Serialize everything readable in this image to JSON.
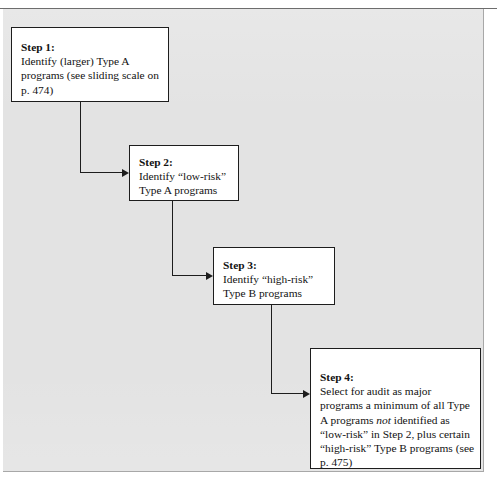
{
  "page": {
    "running_head": "",
    "background_color": "#ffffff",
    "panel_color": "#e3e3e3",
    "box_fill": "#ffffff",
    "line_color": "#1d1d1d"
  },
  "flowchart": {
    "type": "process-flow",
    "orientation": "top-left-to-bottom-right cascade",
    "steps": [
      {
        "id": "step1",
        "title": "Step 1:",
        "body": "Identify (larger) Type A programs (see sliding scale on p. 474)",
        "page_reference": "p. 474"
      },
      {
        "id": "step2",
        "title": "Step 2:",
        "body": "Identify “low-risk” Type A programs"
      },
      {
        "id": "step3",
        "title": "Step 3:",
        "body": "Identify “high-risk” Type B programs"
      },
      {
        "id": "step4",
        "title": "Step 4:",
        "body_part1": "Select for audit as major programs a minimum of all Type A programs ",
        "body_emphasis": "not",
        "body_part2": " identified as “low-risk” in Step 2, plus certain “high-risk” Type B programs (see p. 475)",
        "page_reference": "p. 475"
      }
    ],
    "connectors": [
      {
        "id": "connector-1",
        "from": "step1",
        "to": "step2",
        "shape": "down-then-right",
        "arrowhead": "right"
      },
      {
        "id": "connector-2",
        "from": "step2",
        "to": "step3",
        "shape": "down-then-right",
        "arrowhead": "right"
      },
      {
        "id": "connector-3",
        "from": "step3",
        "to": "step4",
        "shape": "down-then-right",
        "arrowhead": "right"
      }
    ]
  }
}
